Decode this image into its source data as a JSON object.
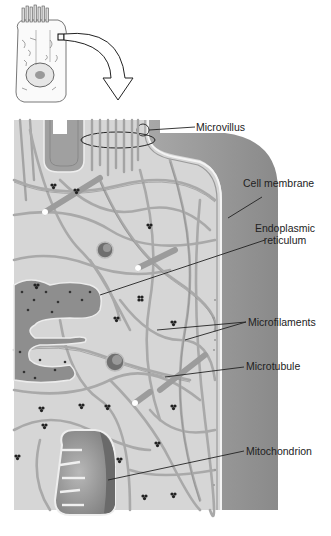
{
  "diagram": {
    "labels": [
      {
        "id": "microvillus",
        "text": "Microvillus"
      },
      {
        "id": "cell-membrane",
        "text": "Cell membrane"
      },
      {
        "id": "endoplasmic-reticulum",
        "line1": "Endoplasmic",
        "line2": "reticulum"
      },
      {
        "id": "microfilaments",
        "text": "Microfilaments"
      },
      {
        "id": "microtubule",
        "text": "Microtubule"
      },
      {
        "id": "mitochondrion",
        "text": "Mitochondrion"
      }
    ],
    "colors": {
      "cytoplasm": "#d4d4d4",
      "membrane_outer": "#8a8a8a",
      "filament": "#a8a8a8",
      "filament_edge": "#7a7a7a",
      "label_line": "#222222",
      "organelle": "#8c8c8c"
    }
  }
}
